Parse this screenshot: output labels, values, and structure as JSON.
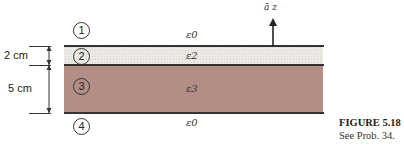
{
  "figure": {
    "regions": [
      {
        "id": "1",
        "label": "1",
        "permittivity": "ε0"
      },
      {
        "id": "2",
        "label": "2",
        "permittivity": "ε2",
        "thickness": "2 cm"
      },
      {
        "id": "3",
        "label": "3",
        "permittivity": "ε3",
        "thickness": "5 cm"
      },
      {
        "id": "4",
        "label": "4",
        "permittivity": "ε0"
      }
    ],
    "unit_vector": "ā z",
    "caption": {
      "title": "FIGURE 5.18",
      "subtitle": "See Prob. 34."
    },
    "colors": {
      "layer2": "#ece9e4",
      "layer3": "#b28e86",
      "lines": "#333333"
    }
  }
}
